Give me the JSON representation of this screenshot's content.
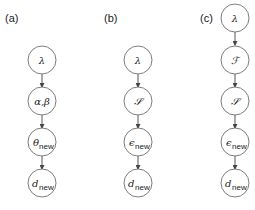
{
  "panels": [
    {
      "label": "(a)",
      "nodes": [
        {
          "symbol": "λ",
          "sub": ""
        },
        {
          "symbol": "α,β",
          "sub": ""
        },
        {
          "symbol": "θ",
          "sub": "new"
        },
        {
          "symbol": "d",
          "sub": "new"
        }
      ]
    },
    {
      "label": "(b)",
      "nodes": [
        {
          "symbol": "λ",
          "sub": ""
        },
        {
          "symbol": "𝒮",
          "sub": ""
        },
        {
          "symbol": "ϵ",
          "sub": "new"
        },
        {
          "symbol": "d",
          "sub": "new"
        }
      ]
    },
    {
      "label": "(c)",
      "nodes": [
        {
          "symbol": "λ",
          "sub": ""
        },
        {
          "symbol": "ℱ",
          "sub": ""
        },
        {
          "symbol": "𝒮",
          "sub": ""
        },
        {
          "symbol": "ϵ",
          "sub": "new"
        },
        {
          "symbol": "d",
          "sub": "new"
        }
      ]
    }
  ],
  "colors": {
    "stroke": "#6e6e6e",
    "edge": "#444444",
    "text": "#222222"
  }
}
